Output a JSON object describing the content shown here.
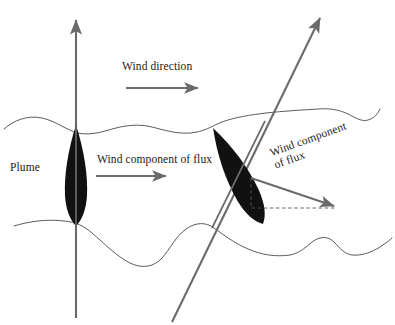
{
  "figure": {
    "background_color": "#ffffff",
    "colors": {
      "arrow_gray": "#6b6b6b",
      "wave_gray": "#4a4a4a",
      "plume_black": "#111111",
      "text_black": "#1a1a1a",
      "dashed_gray": "#555555"
    }
  },
  "labels": {
    "plume": "Plume",
    "wind_direction": "Wind direction",
    "wind_component_of_flux": "Wind component of flux",
    "wind_component_of_flux_tilted_line1": "Wind component",
    "wind_component_of_flux_tilted_line2": "of flux"
  },
  "elements": {
    "vertical_plume_axis_arrow": "vertical-arrow-upward",
    "tilted_plume_axis_arrow": "diagonal-arrow-upward-right",
    "wind_direction_arrow": "horizontal-arrow-right",
    "wind_component_arrow_left": "horizontal-arrow-right",
    "wind_component_arrow_right": "diagonal-arrow-down-right",
    "dashed_triangle": "dashed-right-triangle",
    "upper_wave": "wavy-boundary-line-upper",
    "lower_wave": "wavy-boundary-line-lower",
    "left_plume": "lens-shaped-plume-vertical",
    "right_plume": "lens-shaped-plume-tilted"
  }
}
